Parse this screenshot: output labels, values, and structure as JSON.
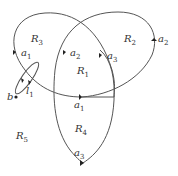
{
  "diagram": {
    "type": "graph-embedding",
    "curves": [
      {
        "id": "left-loop",
        "edge_label": "a1"
      },
      {
        "id": "right-loop",
        "edge_labels": [
          "a2",
          "a3"
        ]
      },
      {
        "id": "bottom-loop",
        "edge_label": "a3"
      },
      {
        "id": "small-loop",
        "edge_label": "l1"
      }
    ],
    "vertex": {
      "label": "b"
    },
    "regions": [
      "R1",
      "R2",
      "R3",
      "R4",
      "R5"
    ],
    "labels": {
      "R1": {
        "base": "R",
        "sub": "1"
      },
      "R2": {
        "base": "R",
        "sub": "2"
      },
      "R3": {
        "base": "R",
        "sub": "3"
      },
      "R4": {
        "base": "R",
        "sub": "4"
      },
      "R5": {
        "base": "R",
        "sub": "5"
      },
      "a1_left": {
        "base": "a",
        "sub": "1"
      },
      "a2_mid": {
        "base": "a",
        "sub": "2"
      },
      "a3_mid": {
        "base": "a",
        "sub": "3"
      },
      "a2_right": {
        "base": "a",
        "sub": "2"
      },
      "a1_bottom": {
        "base": "a",
        "sub": "1"
      },
      "a3_bottom": {
        "base": "a",
        "sub": "3"
      },
      "l1": {
        "base": "l",
        "sub": "1"
      },
      "b": {
        "base": "b",
        "sub": ""
      }
    }
  }
}
